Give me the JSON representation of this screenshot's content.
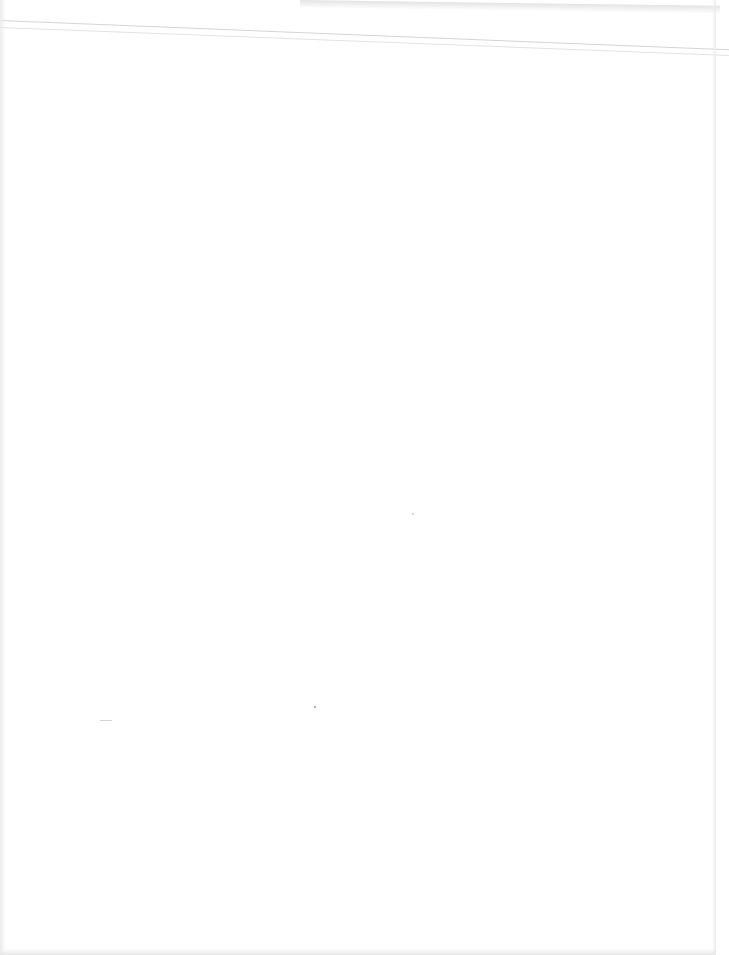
{
  "document": {
    "type": "blank scanned page",
    "text_content": "",
    "colors": {
      "paper": "#ffffff",
      "fold_lines": "#cfcfcf",
      "edge_shadow": "#e6e6e6"
    }
  }
}
